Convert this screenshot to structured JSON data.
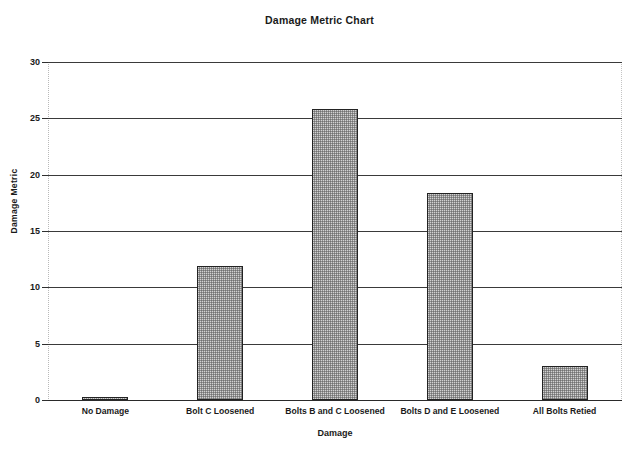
{
  "chart_data": {
    "type": "bar",
    "title": "Damage Metric Chart",
    "xlabel": "Damage",
    "ylabel": "Damage Metric",
    "categories": [
      "No Damage",
      "Bolt C Loosened",
      "Bolts B and C Loosened",
      "Bolts D and E Loosened",
      "All Bolts Retied"
    ],
    "values": [
      0.2,
      11.9,
      25.8,
      18.4,
      3.0
    ],
    "ylim": [
      0,
      30
    ],
    "yticks": [
      0,
      5,
      10,
      15,
      20,
      25,
      30
    ],
    "ytick_labels": [
      "0",
      "5",
      "10",
      "15",
      "20",
      "25",
      "30"
    ],
    "grid": true,
    "legend": false,
    "bar_fill": "#d2d2d2",
    "bar_edge": "#232323",
    "background": "#ffffff"
  }
}
